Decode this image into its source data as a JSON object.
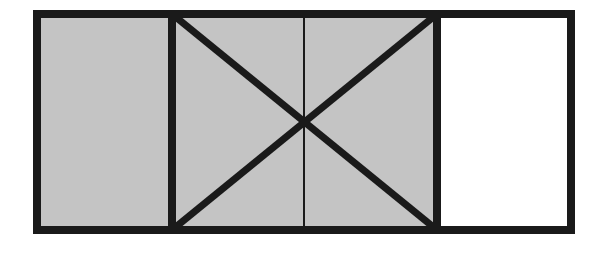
{
  "diagram": {
    "colors": {
      "stroke": "#1a1a1a",
      "shaded": "#c4c4c4",
      "unshaded": "#ffffff"
    },
    "outer_rect": {
      "x": 37,
      "y": 14,
      "w": 534,
      "h": 216
    },
    "divider_left_x": 172,
    "divider_right_x": 437,
    "center": {
      "x": 304,
      "y": 122
    }
  }
}
